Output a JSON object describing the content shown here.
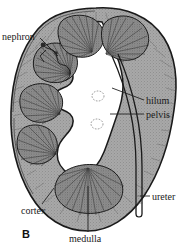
{
  "figure": {
    "panel_letter": "B",
    "width": 192,
    "height": 250,
    "background_color": "#ffffff"
  },
  "labels": {
    "nephron": "nephron",
    "hilum": "hilum",
    "pelvis": "pelvis",
    "ureter": "ureter",
    "cortex": "cortex",
    "medulla": "medulla"
  },
  "colors": {
    "outline": "#1a1a1a",
    "cortex_fill": "#a6a6a6",
    "medulla_fill": "#8c8c8c",
    "pelvis_fill": "#ffffff",
    "vessel_outline": "#777777",
    "text": "#1a1a1a",
    "leader_line": "#222222"
  },
  "structures": [
    {
      "name": "cortex",
      "description": "outer stippled gray band of kidney"
    },
    {
      "name": "medulla",
      "description": "renal pyramids with radiating striations"
    },
    {
      "name": "pelvis",
      "description": "central white funnel-shaped cavity"
    },
    {
      "name": "hilum",
      "description": "medial notch where vessels and ureter enter"
    },
    {
      "name": "ureter",
      "description": "narrow tube descending from pelvis"
    },
    {
      "name": "nephron",
      "description": "fine tubule detail in upper left cortex"
    }
  ]
}
